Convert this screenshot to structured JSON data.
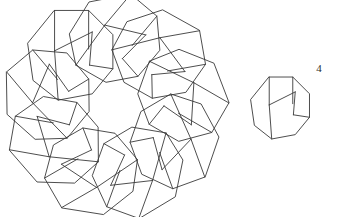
{
  "figure": {
    "background_color": "#ffffff",
    "stroke_color": "#3a3a3a",
    "stroke_width": 0.9,
    "label_color": "#2b2b2b"
  },
  "labels": {
    "single_tile_label": "4"
  },
  "chart_data": {
    "type": "diagram",
    "assembly": {
      "name": "nine-tile-ring",
      "tile_count": 9,
      "rotational_symmetry_order": 9,
      "center": [
        115,
        107
      ],
      "outer_radius": 102,
      "inner_hole_radius": 33,
      "rotation_step_degrees": 40,
      "base_rotation_degrees": -90
    },
    "unit_tile": {
      "name": "octagonal-tile",
      "label": "4",
      "center": [
        281,
        108
      ],
      "scale": 0.46,
      "outline_vertex_count": 8,
      "interior_edge_count": 4
    },
    "tile_prototype": {
      "comment": "Tile polygon and its interior crease lines, expressed in a local unit frame (x right, y down), radius ~1.",
      "outline": [
        [
          -0.38,
          -1.0
        ],
        [
          0.38,
          -1.0
        ],
        [
          0.92,
          -0.46
        ],
        [
          0.92,
          0.3
        ],
        [
          0.46,
          0.86
        ],
        [
          -0.3,
          1.0
        ],
        [
          -0.86,
          0.56
        ],
        [
          -0.98,
          -0.26
        ]
      ],
      "interior_edges": [
        [
          [
            -0.38,
            -1.0
          ],
          [
            -0.38,
            -0.1
          ]
        ],
        [
          [
            -0.38,
            -0.1
          ],
          [
            -0.3,
            1.0
          ]
        ],
        [
          [
            0.38,
            -1.0
          ],
          [
            0.38,
            -0.14
          ]
        ],
        [
          [
            -0.38,
            -0.1
          ],
          [
            0.46,
            -0.52
          ]
        ],
        [
          [
            0.46,
            -0.52
          ],
          [
            0.4,
            0.22
          ]
        ],
        [
          [
            0.4,
            0.22
          ],
          [
            0.92,
            0.3
          ]
        ]
      ]
    },
    "xlim": [
      0,
      339
    ],
    "ylim": [
      217,
      0
    ],
    "grid": false,
    "legend": false
  }
}
